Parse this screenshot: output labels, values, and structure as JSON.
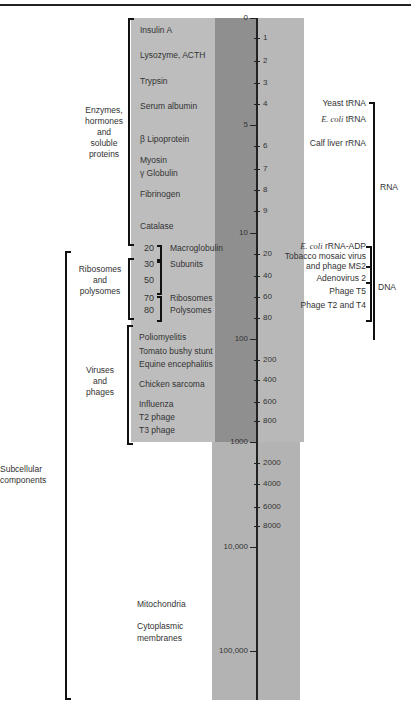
{
  "axis": {
    "ticks": [
      {
        "label": "0",
        "y": 18,
        "major": true
      },
      {
        "label": "1",
        "y": 38
      },
      {
        "label": "2",
        "y": 61
      },
      {
        "label": "3",
        "y": 83
      },
      {
        "label": "4",
        "y": 104
      },
      {
        "label": "5",
        "y": 125,
        "major": true
      },
      {
        "label": "6",
        "y": 146
      },
      {
        "label": "7",
        "y": 169
      },
      {
        "label": "8",
        "y": 190
      },
      {
        "label": "9",
        "y": 211
      },
      {
        "label": "10",
        "y": 233,
        "major": true
      },
      {
        "label": "20",
        "y": 254
      },
      {
        "label": "40",
        "y": 276
      },
      {
        "label": "60",
        "y": 297
      },
      {
        "label": "80",
        "y": 318
      },
      {
        "label": "100",
        "y": 339,
        "major": true
      },
      {
        "label": "200",
        "y": 360
      },
      {
        "label": "400",
        "y": 380
      },
      {
        "label": "600",
        "y": 402
      },
      {
        "label": "800",
        "y": 421
      },
      {
        "label": "1000",
        "y": 442,
        "major": true
      },
      {
        "label": "2000",
        "y": 463
      },
      {
        "label": "4000",
        "y": 484
      },
      {
        "label": "6000",
        "y": 507
      },
      {
        "label": "8000",
        "y": 526
      },
      {
        "label": "10,000",
        "y": 547,
        "major": true
      },
      {
        "label": "100,000",
        "y": 651,
        "major": true
      }
    ]
  },
  "left_items": [
    {
      "label": "Insulin A",
      "y": 30
    },
    {
      "label": "Lysozyme, ACTH",
      "y": 55
    },
    {
      "label": "Trypsin",
      "y": 81
    },
    {
      "label": "Serum albumin",
      "y": 106
    },
    {
      "label": "β Lipoprotein",
      "y": 139
    },
    {
      "label": "Myosin",
      "y": 160
    },
    {
      "label": "γ Globulin",
      "y": 173
    },
    {
      "label": "Fibrinogen",
      "y": 194
    },
    {
      "label": "Catalase",
      "y": 226
    }
  ],
  "ribosome_items": [
    {
      "num": "20",
      "label": "Macroglobulin",
      "y": 248
    },
    {
      "num": "30",
      "label": "Subunits",
      "y": 264
    },
    {
      "num": "50",
      "label": "",
      "y": 280
    },
    {
      "num": "70",
      "label": "Ribosomes",
      "y": 298
    },
    {
      "num": "80",
      "label": "Polysomes",
      "y": 310
    }
  ],
  "virus_items": [
    {
      "label": "Poliomyelitis",
      "y": 337
    },
    {
      "label": "Tomato bushy stunt",
      "y": 351
    },
    {
      "label": "Equine encephalitis",
      "y": 364
    },
    {
      "label": "Chicken sarcoma",
      "y": 384
    },
    {
      "label": "Influenza",
      "y": 404
    },
    {
      "label": "T2 phage",
      "y": 417
    },
    {
      "label": "T3 phage",
      "y": 430
    }
  ],
  "subcellular_items": [
    {
      "label": "Mitochondria",
      "y": 604
    },
    {
      "label": "Cytoplasmic",
      "y": 626
    },
    {
      "label": "membranes",
      "y": 638
    }
  ],
  "groups": {
    "enzymes": [
      "Enzymes,",
      "hormones",
      "and",
      "soluble",
      "proteins"
    ],
    "ribosomes": [
      "Ribosomes",
      "and",
      "polysomes"
    ],
    "viruses": [
      "Viruses",
      "and",
      "phages"
    ],
    "subcellular": [
      "Subcellular",
      "components"
    ]
  },
  "right_items": [
    {
      "label": "Yeast tRNA",
      "y": 103
    },
    {
      "label_italic": "E. coli",
      "label": " tRNA",
      "y": 119
    },
    {
      "label": "Calf liver rRNA",
      "y": 143
    },
    {
      "label_italic": "E. coli",
      "label": " rRNA-ADP",
      "y": 246
    },
    {
      "label": "Tobacco mosaic virus",
      "y": 256
    },
    {
      "label": "and phage MS2",
      "y": 266
    },
    {
      "label": "Adenovirus 2",
      "y": 278
    },
    {
      "label": "Phage T5",
      "y": 291
    },
    {
      "label": "Phage T2 and T4",
      "y": 305
    }
  ],
  "right_groups": {
    "rna": "RNA",
    "dna": "DNA"
  }
}
